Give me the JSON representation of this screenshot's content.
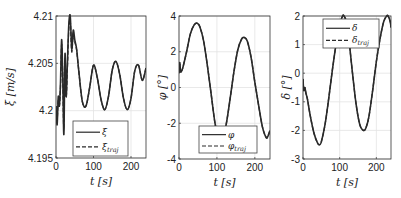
{
  "chart_data": [
    {
      "type": "line",
      "title": "",
      "xlabel": "t [s]",
      "ylabel": "ξ̇ [m/s]",
      "xlim": [
        0,
        240
      ],
      "ylim": [
        4.195,
        4.21
      ],
      "xticks": [
        0,
        100,
        200
      ],
      "xtick_labels": [
        "0",
        "100",
        "200"
      ],
      "yticks": [
        4.195,
        4.2,
        4.205,
        4.21
      ],
      "ytick_labels": [
        "4.195",
        "4.2",
        "4.205",
        "4.21"
      ],
      "grid": true,
      "legend": {
        "position": "lower left",
        "entries": [
          "ξ̇",
          "ξ̇traj"
        ]
      },
      "series": [
        {
          "name": "ξ̇",
          "style": "solid",
          "x": [
            0,
            3,
            6,
            9,
            12,
            15,
            18,
            21,
            24,
            27,
            30,
            34,
            38,
            42,
            46,
            50,
            55,
            60,
            70,
            80,
            90,
            100,
            110,
            120,
            130,
            140,
            150,
            160,
            170,
            180,
            190,
            200,
            210,
            220,
            230,
            240
          ],
          "y": [
            4.2005,
            4.1985,
            4.2015,
            4.2005,
            4.203,
            4.2075,
            4.2035,
            4.1975,
            4.206,
            4.2015,
            4.2045,
            4.209,
            4.21,
            4.2065,
            4.2085,
            4.2075,
            4.2065,
            4.2045,
            4.201,
            4.2005,
            4.2025,
            4.2048,
            4.2035,
            4.2012,
            4.2001,
            4.2015,
            4.2043,
            4.2052,
            4.2038,
            4.2013,
            4.2001,
            4.2013,
            4.2042,
            4.2048,
            4.2032,
            4.2045
          ]
        },
        {
          "name": "ξ̇traj",
          "style": "dashed",
          "x": [
            0,
            3,
            6,
            9,
            12,
            15,
            18,
            21,
            24,
            27,
            30,
            34,
            38,
            42,
            46,
            50,
            55,
            60,
            70,
            80,
            90,
            100,
            110,
            120,
            130,
            140,
            150,
            160,
            170,
            180,
            190,
            200,
            210,
            220,
            230,
            240
          ],
          "y": [
            4.2005,
            4.199,
            4.2012,
            4.2005,
            4.2025,
            4.207,
            4.2035,
            4.198,
            4.2055,
            4.2015,
            4.204,
            4.2085,
            4.2095,
            4.2062,
            4.2082,
            4.2073,
            4.2064,
            4.2045,
            4.201,
            4.2005,
            4.2025,
            4.2048,
            4.2035,
            4.2012,
            4.2001,
            4.2015,
            4.2043,
            4.2052,
            4.2038,
            4.2013,
            4.2001,
            4.2013,
            4.2042,
            4.2048,
            4.2032,
            4.2045
          ]
        }
      ]
    },
    {
      "type": "line",
      "title": "",
      "xlabel": "t [s]",
      "ylabel": "φ [°]",
      "xlim": [
        0,
        240
      ],
      "ylim": [
        -4,
        4
      ],
      "xticks": [
        0,
        100,
        200
      ],
      "xtick_labels": [
        "0",
        "100",
        "200"
      ],
      "yticks": [
        -4,
        -2,
        0,
        2,
        4
      ],
      "ytick_labels": [
        "-4",
        "-2",
        "0",
        "2",
        "4"
      ],
      "grid": true,
      "legend": {
        "position": "lower center",
        "entries": [
          "φ",
          "φtraj"
        ]
      },
      "series": [
        {
          "name": "φ",
          "style": "solid",
          "x": [
            0,
            2,
            4,
            6,
            10,
            20,
            30,
            40,
            48,
            55,
            65,
            75,
            85,
            95,
            105,
            115,
            125,
            135,
            145,
            155,
            165,
            172,
            180,
            190,
            200,
            210,
            220,
            230,
            235,
            240
          ],
          "y": [
            0.8,
            1.4,
            0.9,
            0.9,
            1.1,
            2.0,
            3.0,
            3.5,
            3.6,
            3.4,
            2.6,
            1.2,
            -0.4,
            -2.0,
            -2.9,
            -2.9,
            -2.0,
            -0.6,
            0.9,
            2.1,
            2.7,
            2.8,
            2.6,
            1.7,
            0.3,
            -1.0,
            -2.2,
            -2.8,
            -2.7,
            -2.4
          ]
        },
        {
          "name": "φtraj",
          "style": "dashed",
          "x": [
            0,
            2,
            4,
            6,
            10,
            20,
            30,
            40,
            48,
            55,
            65,
            75,
            85,
            95,
            105,
            115,
            125,
            135,
            145,
            155,
            165,
            172,
            180,
            190,
            200,
            210,
            220,
            230,
            235,
            240
          ],
          "y": [
            0.8,
            1.3,
            0.9,
            0.9,
            1.1,
            2.0,
            3.0,
            3.5,
            3.6,
            3.4,
            2.6,
            1.2,
            -0.4,
            -2.0,
            -2.9,
            -2.9,
            -2.0,
            -0.6,
            0.9,
            2.1,
            2.7,
            2.8,
            2.6,
            1.7,
            0.3,
            -1.0,
            -2.2,
            -2.8,
            -2.7,
            -2.4
          ]
        }
      ]
    },
    {
      "type": "line",
      "title": "",
      "xlabel": "t [s]",
      "ylabel": "δ [°]",
      "xlim": [
        0,
        240
      ],
      "ylim": [
        -3,
        2
      ],
      "xticks": [
        0,
        100,
        200
      ],
      "xtick_labels": [
        "0",
        "100",
        "200"
      ],
      "yticks": [
        -3,
        -2,
        -1,
        0,
        1,
        2
      ],
      "ytick_labels": [
        "-3",
        "-2",
        "-1",
        "0",
        "1",
        "2"
      ],
      "grid": true,
      "legend": {
        "position": "upper center",
        "entries": [
          "δ",
          "δtraj"
        ]
      },
      "series": [
        {
          "name": "δ",
          "style": "solid",
          "x": [
            0,
            2,
            5,
            8,
            12,
            20,
            30,
            40,
            45,
            50,
            60,
            70,
            80,
            90,
            100,
            108,
            112,
            118,
            125,
            135,
            145,
            155,
            165,
            172,
            180,
            190,
            200,
            210,
            220,
            228,
            232,
            238,
            240
          ],
          "y": [
            -0.2,
            -0.6,
            -0.5,
            -0.7,
            -0.9,
            -1.5,
            -2.1,
            -2.45,
            -2.5,
            -2.4,
            -1.8,
            -0.9,
            0.1,
            1.0,
            1.7,
            2.0,
            2.0,
            1.8,
            1.2,
            0.0,
            -1.1,
            -1.8,
            -2.0,
            -1.9,
            -1.5,
            -0.6,
            0.4,
            1.2,
            1.8,
            2.0,
            2.0,
            1.8,
            1.6
          ]
        },
        {
          "name": "δtraj",
          "style": "dashed",
          "x": [
            0,
            2,
            5,
            8,
            12,
            20,
            30,
            40,
            45,
            50,
            60,
            70,
            80,
            90,
            100,
            108,
            112,
            118,
            125,
            135,
            145,
            155,
            165,
            172,
            180,
            190,
            200,
            210,
            220,
            228,
            232,
            238,
            240
          ],
          "y": [
            -0.2,
            -0.6,
            -0.5,
            -0.7,
            -0.9,
            -1.5,
            -2.1,
            -2.45,
            -2.5,
            -2.4,
            -1.8,
            -0.9,
            0.1,
            1.0,
            1.7,
            2.0,
            2.0,
            1.8,
            1.2,
            0.0,
            -1.1,
            -1.8,
            -2.0,
            -1.9,
            -1.5,
            -0.6,
            0.4,
            1.2,
            1.8,
            2.0,
            2.0,
            1.8,
            1.6
          ]
        }
      ]
    }
  ],
  "layout": {
    "panels": [
      {
        "left": 56,
        "top": 16,
        "right": 146,
        "bottom": 158,
        "legend_box": [
          73,
          121,
          128,
          156
        ]
      },
      {
        "left": 179,
        "top": 16,
        "right": 270,
        "bottom": 159,
        "legend_box": [
          199,
          126,
          257,
          153
        ]
      },
      {
        "left": 303,
        "top": 16,
        "right": 391,
        "bottom": 159,
        "legend_box": [
          323,
          19,
          379,
          48
        ]
      }
    ]
  },
  "labels": {
    "panel1": {
      "y_main": "ξ̇",
      "y_unit": "[m/s]",
      "x": "t [s]",
      "legend_solid": "ξ̇",
      "legend_dash": "ξ̇",
      "legend_dash_sub": "traj"
    },
    "panel2": {
      "y_main": "φ",
      "y_unit": "[°]",
      "x": "t [s]",
      "legend_solid": "φ",
      "legend_dash": "φ",
      "legend_dash_sub": "traj"
    },
    "panel3": {
      "y_main": "δ",
      "y_unit": "[°]",
      "x": "t [s]",
      "legend_solid": "δ",
      "legend_dash": "δ",
      "legend_dash_sub": "traj"
    }
  },
  "colors": {
    "line": "#2a2a2a",
    "grid": "#e3e3e3",
    "axis": "#333333",
    "legend_border": "#444444",
    "background": "#ffffff"
  }
}
